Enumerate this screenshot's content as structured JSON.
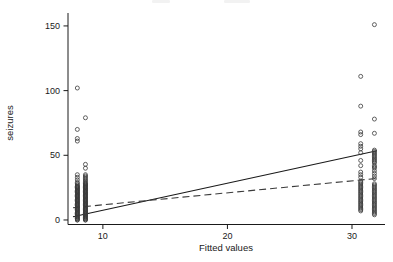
{
  "figure": {
    "background": "#ffffff",
    "ink_color": "#1a1a1a",
    "clipped_title_note": ""
  },
  "chart_data": {
    "type": "scatter",
    "title": "",
    "xlabel": "Fitted values",
    "ylabel": "seizures",
    "xticks": [
      10,
      20,
      30
    ],
    "yticks": [
      0,
      50,
      100,
      150
    ],
    "xlim": [
      7.2,
      32.65
    ],
    "ylim": [
      -3.5,
      160
    ],
    "grid": false,
    "legend": "none",
    "marker": {
      "shape": "open-circle",
      "radius": 2,
      "color": "#3a3a3a"
    },
    "series": [
      {
        "name": "observed-cluster-fitted-8.0",
        "type": "scatter",
        "x": 7.95,
        "y": [
          102,
          70,
          63,
          61,
          35,
          33,
          31,
          29,
          28,
          27,
          26,
          26,
          25,
          25,
          24,
          24,
          23,
          23,
          22,
          22,
          21,
          21,
          20,
          20,
          19,
          19,
          18,
          18,
          17,
          17,
          16,
          16,
          15,
          15,
          14,
          14,
          13,
          13,
          12,
          12,
          11,
          11,
          10,
          10,
          9,
          9,
          8,
          8,
          7,
          7,
          6,
          6,
          5,
          5,
          4,
          4,
          3,
          3,
          2,
          2,
          1,
          1,
          0,
          0
        ]
      },
      {
        "name": "observed-cluster-fitted-8.6",
        "type": "scatter",
        "x": 8.6,
        "y": [
          79,
          43,
          40,
          35,
          34,
          33,
          32,
          31,
          30,
          29,
          28,
          28,
          27,
          27,
          26,
          26,
          25,
          25,
          24,
          24,
          23,
          23,
          22,
          22,
          21,
          21,
          20,
          20,
          19,
          19,
          18,
          18,
          17,
          17,
          16,
          16,
          15,
          15,
          14,
          14,
          13,
          13,
          12,
          12,
          11,
          11,
          10,
          10,
          9,
          9,
          8,
          8,
          7,
          7,
          6,
          6,
          5,
          5,
          4,
          4,
          3,
          3,
          2,
          2,
          1,
          1,
          0,
          0
        ]
      },
      {
        "name": "observed-cluster-fitted-30.7",
        "type": "scatter",
        "x": 30.7,
        "y": [
          111,
          88,
          68,
          66,
          59,
          57,
          55,
          52,
          46,
          42,
          37,
          35,
          33,
          30,
          29,
          28,
          27,
          26,
          25,
          24,
          23,
          22,
          21,
          20,
          19,
          18,
          17,
          16,
          15,
          14,
          13,
          12,
          11,
          10,
          9,
          8,
          7
        ]
      },
      {
        "name": "observed-cluster-fitted-31.8",
        "type": "scatter",
        "x": 31.8,
        "y": [
          151,
          78,
          67,
          54,
          53,
          52,
          51,
          50,
          49,
          48,
          47,
          46,
          45,
          44,
          42,
          41,
          40,
          38,
          36,
          34,
          32,
          28,
          27,
          26,
          25,
          24,
          23,
          22,
          21,
          20,
          19,
          18,
          17,
          16,
          15,
          14,
          13,
          12,
          11,
          10,
          9,
          8,
          7,
          6,
          5,
          4
        ]
      },
      {
        "name": "fit-line-solid",
        "type": "line",
        "style": "solid",
        "color": "#1a1a1a",
        "x": [
          7.6,
          32.0
        ],
        "y": [
          2.5,
          53.5
        ]
      },
      {
        "name": "fit-line-dashed",
        "type": "line",
        "style": "dashed",
        "color": "#3a3a3a",
        "x": [
          7.6,
          31.9
        ],
        "y": [
          9.5,
          32.0
        ]
      }
    ]
  }
}
